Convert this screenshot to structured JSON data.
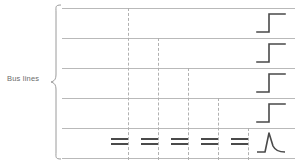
{
  "figure": {
    "width": 295,
    "height": 164,
    "background": "#ffffff"
  },
  "label": {
    "text": "Bus lines",
    "color": "#6b6b6b"
  },
  "brace": {
    "name": "left-curly-brace",
    "color": "#9a9a9a",
    "orientation": "right-pointing"
  },
  "colors": {
    "bus_line": "#b9b9b9",
    "dashed_line": "#b0b0b0",
    "waveform": "#4a4a4a",
    "equal_mark": "#4a4a4a"
  },
  "bus_lines": {
    "count": 5,
    "rule_count": 6,
    "rule_y": [
      8,
      38,
      68,
      98,
      128,
      158
    ],
    "rows": [
      {
        "index": 1,
        "name": "bus-line-row-1",
        "dashed_count": 1,
        "waveform": "rising-edge-step"
      },
      {
        "index": 2,
        "name": "bus-line-row-2",
        "dashed_count": 2,
        "waveform": "rising-edge-step"
      },
      {
        "index": 3,
        "name": "bus-line-row-3",
        "dashed_count": 3,
        "waveform": "rising-edge-step"
      },
      {
        "index": 4,
        "name": "bus-line-row-4",
        "dashed_count": 4,
        "waveform": "rising-edge-step"
      },
      {
        "index": 5,
        "name": "bus-line-row-5",
        "dashed_count": 5,
        "waveform": "pulse-spike"
      }
    ]
  },
  "dashed_columns": {
    "count": 5,
    "x": [
      66,
      96,
      126,
      156,
      186
    ],
    "start_row": [
      1,
      2,
      3,
      4,
      5
    ]
  },
  "equal_marks": {
    "count": 5,
    "label": "==",
    "x": [
      58,
      88,
      118,
      148,
      178
    ],
    "y": 138
  }
}
